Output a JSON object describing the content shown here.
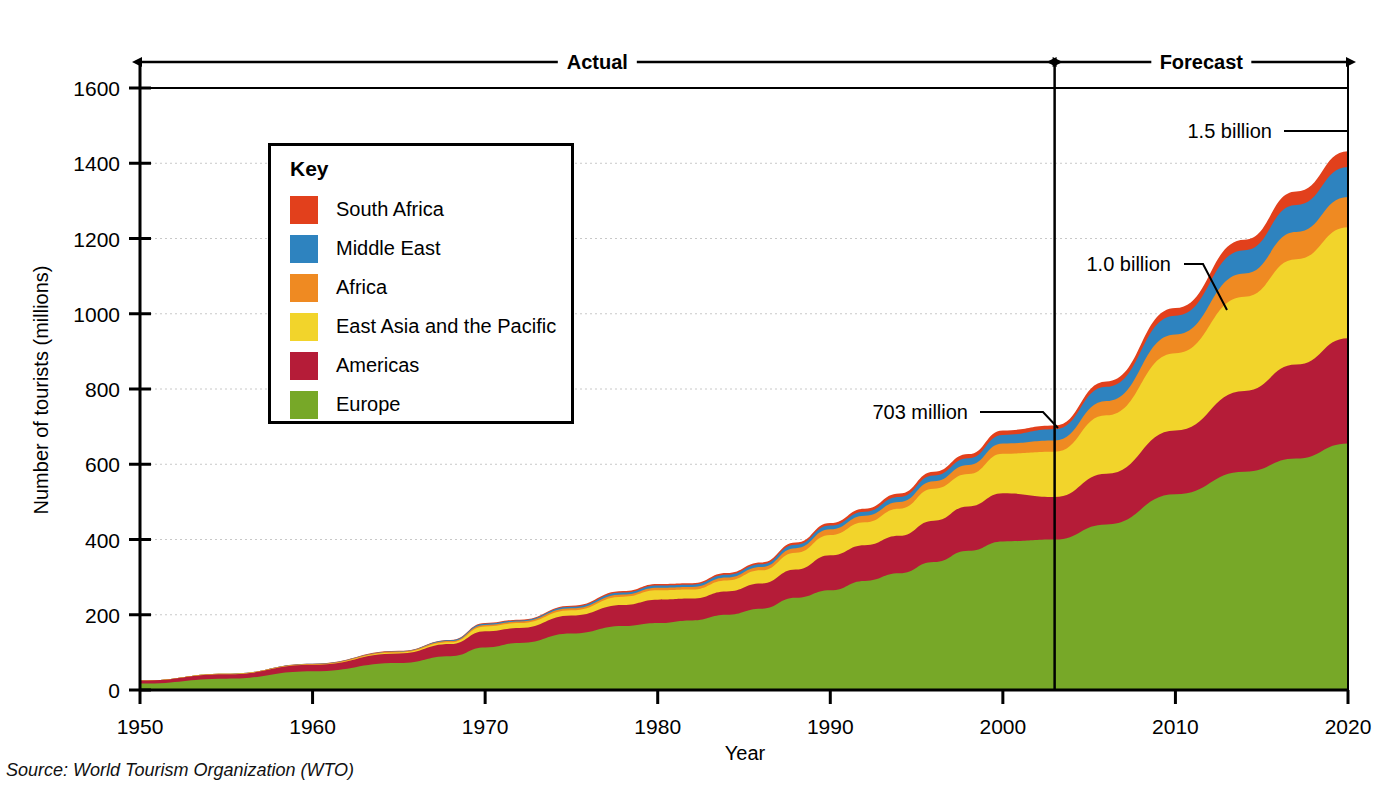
{
  "source_note": "Source: World Tourism Organization (WTO)",
  "legend": {
    "title": "Key",
    "items": [
      {
        "label": "South Africa",
        "color": "#e2401c"
      },
      {
        "label": "Middle East",
        "color": "#2e83bf"
      },
      {
        "label": "Africa",
        "color": "#ef8a22"
      },
      {
        "label": "East Asia and the Pacific",
        "color": "#f2d42b"
      },
      {
        "label": "Americas",
        "color": "#b51c38"
      },
      {
        "label": "Europe",
        "color": "#77a828"
      }
    ]
  },
  "brackets": [
    {
      "label": "Actual"
    },
    {
      "label": "Forecast"
    }
  ],
  "callouts": [
    {
      "label": "1.5 billion"
    },
    {
      "label": "1.0 billion"
    },
    {
      "label": "703 million"
    }
  ],
  "chart_data": {
    "type": "area",
    "stacked": true,
    "title": "",
    "xlabel": "Year",
    "ylabel": "Number of tourists (millions)",
    "xlim": [
      1950,
      2020
    ],
    "ylim": [
      0,
      1600
    ],
    "xticks": [
      1950,
      1960,
      1970,
      1980,
      1990,
      2000,
      2010,
      2020
    ],
    "yticks": [
      0,
      200,
      400,
      600,
      800,
      1000,
      1200,
      1400,
      1600
    ],
    "grid": true,
    "grid_style": "dotted-horizontal",
    "legend_position": "inside-upper-left",
    "forecast_divider_x": 2003,
    "annotations": [
      {
        "text": "Actual",
        "type": "bracket",
        "x_from": 1950,
        "x_to": 2003
      },
      {
        "text": "Forecast",
        "type": "bracket",
        "x_from": 2003,
        "x_to": 2020
      },
      {
        "text": "703 million",
        "type": "leader",
        "x": 2003,
        "y": 703
      },
      {
        "text": "1.0 billion",
        "type": "leader",
        "x": 2010,
        "y": 1000
      },
      {
        "text": "1.5 billion",
        "type": "leader",
        "x": 2020,
        "y": 1500
      }
    ],
    "x": [
      1950,
      1955,
      1960,
      1965,
      1968,
      1970,
      1972,
      1975,
      1978,
      1980,
      1982,
      1984,
      1986,
      1988,
      1990,
      1992,
      1994,
      1996,
      1998,
      2000,
      2003,
      2006,
      2010,
      2014,
      2017,
      2020
    ],
    "series": [
      {
        "name": "Europe",
        "color": "#77a828",
        "values": [
          17,
          30,
          50,
          72,
          90,
          113,
          125,
          150,
          170,
          178,
          185,
          200,
          216,
          245,
          265,
          290,
          310,
          340,
          370,
          395,
          400,
          440,
          520,
          580,
          615,
          655
        ]
      },
      {
        "name": "Americas",
        "color": "#b51c38",
        "values": [
          8,
          12,
          17,
          25,
          32,
          43,
          40,
          48,
          56,
          62,
          58,
          62,
          67,
          75,
          93,
          95,
          100,
          110,
          118,
          128,
          113,
          135,
          170,
          215,
          250,
          280
        ]
      },
      {
        "name": "East Asia and the Pacific",
        "color": "#f2d42b",
        "values": [
          0,
          1,
          1,
          3,
          5,
          13,
          13,
          14,
          22,
          25,
          24,
          29,
          35,
          45,
          54,
          61,
          72,
          85,
          86,
          105,
          120,
          155,
          205,
          250,
          280,
          295
        ]
      },
      {
        "name": "Africa",
        "color": "#ef8a22",
        "values": [
          0,
          0,
          1,
          2,
          3,
          4,
          4,
          5,
          6,
          7,
          7,
          8,
          9,
          12,
          15,
          17,
          18,
          20,
          24,
          27,
          30,
          38,
          50,
          62,
          72,
          80
        ]
      },
      {
        "name": "Middle East",
        "color": "#2e83bf",
        "values": [
          0,
          0,
          1,
          1,
          2,
          3,
          3,
          4,
          5,
          6,
          6,
          7,
          7,
          9,
          10,
          11,
          13,
          15,
          18,
          23,
          30,
          38,
          50,
          62,
          72,
          80
        ]
      },
      {
        "name": "South Africa",
        "color": "#e2401c",
        "values": [
          0,
          0,
          0,
          1,
          1,
          2,
          2,
          3,
          4,
          4,
          4,
          5,
          5,
          6,
          7,
          8,
          9,
          10,
          11,
          12,
          10,
          14,
          20,
          28,
          36,
          42
        ]
      }
    ]
  }
}
